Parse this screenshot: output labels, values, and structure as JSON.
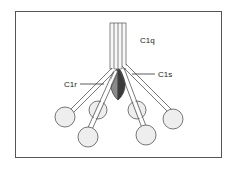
{
  "diagram": {
    "labels": {
      "c1q": "C1q",
      "c1r": "C1r",
      "c1s": "C1s"
    },
    "colors": {
      "c1r": "#8a8a8a",
      "c1s": "#3a3a3a",
      "globular_head": "#eeeeee",
      "stalk": "#f4f4f4",
      "outline": "#444444"
    }
  }
}
